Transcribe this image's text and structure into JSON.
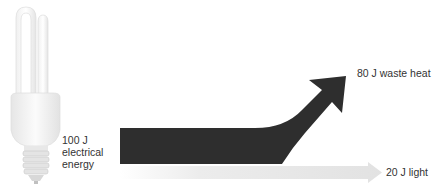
{
  "diagram": {
    "input": {
      "line1": "100 J",
      "line2": "electrical",
      "line3": "energy"
    },
    "outputs": [
      {
        "label": "80 J waste heat",
        "value": 80,
        "color": "#3a3a3a"
      },
      {
        "label": "20 J light",
        "value": 20,
        "color": "#e8e8e8"
      }
    ],
    "icons": {
      "bulb": "compact-fluorescent-bulb-icon"
    }
  }
}
